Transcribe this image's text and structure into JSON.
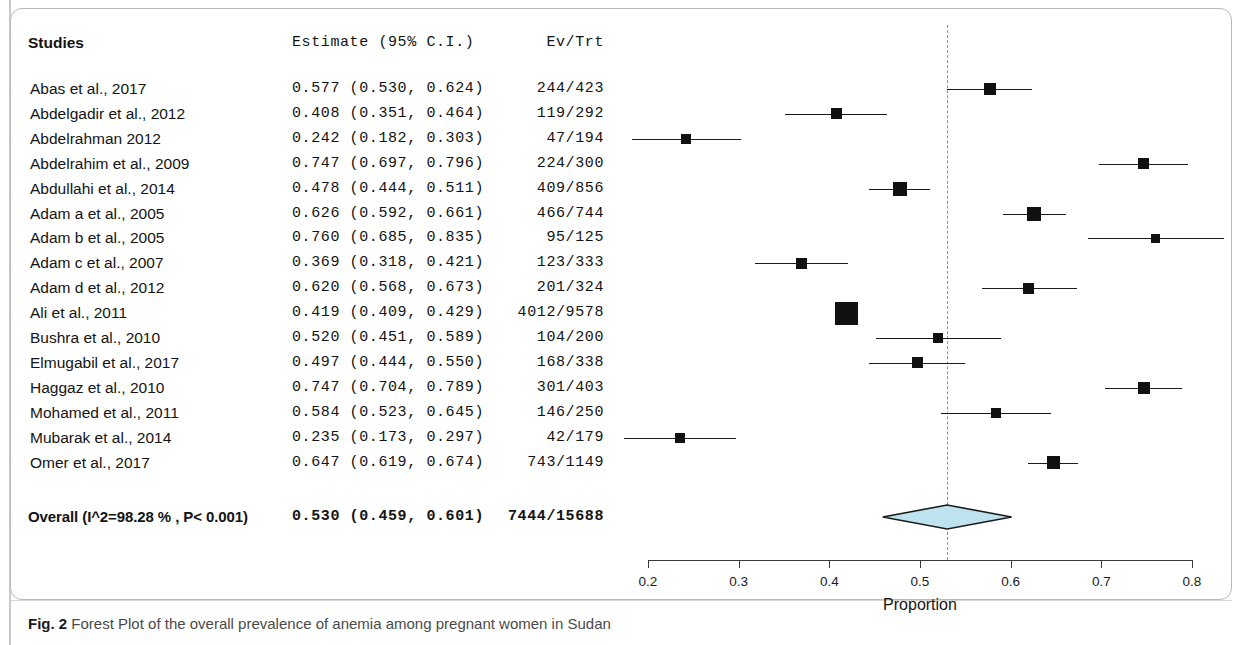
{
  "figure": {
    "caption_label": "Fig. 2",
    "caption_text": "Forest Plot of the overall prevalence of anemia among pregnant women in Sudan"
  },
  "table": {
    "headers": {
      "studies": "Studies",
      "estimate": "Estimate (95% C.I.)",
      "evtrt": "Ev/Trt"
    }
  },
  "chart_data": {
    "type": "forest",
    "title": "Forest Plot of the overall prevalence of anemia among pregnant women in Sudan",
    "xlabel": "Proportion",
    "ylabel": "",
    "xlim": [
      0.2,
      0.8
    ],
    "xticks": [
      0.2,
      0.3,
      0.4,
      0.5,
      0.6,
      0.7,
      0.8
    ],
    "xticklabels": [
      "0.2",
      "0.3",
      "0.4",
      "0.5",
      "0.6",
      "0.7",
      "0.8"
    ],
    "grid": false,
    "reference_line": 0.53,
    "reference_line_color": "#e0705f",
    "marker_color": "#111111",
    "diamond_fill": "#bfe2ef",
    "diamond_stroke": "#1b1b1b",
    "columns": [
      "Studies",
      "Estimate (95% C.I.)",
      "Ev/Trt"
    ],
    "rows": [
      {
        "study": "Abas et al.,  2017",
        "estimate": 0.577,
        "ci_low": 0.53,
        "ci_high": 0.624,
        "estimate_text": "0.577 (0.530, 0.624)",
        "events": 244,
        "total": 423,
        "evtrt": "244/423",
        "weight_px": 12
      },
      {
        "study": "Abdelgadir et al., 2012",
        "estimate": 0.408,
        "ci_low": 0.351,
        "ci_high": 0.464,
        "estimate_text": "0.408 (0.351, 0.464)",
        "events": 119,
        "total": 292,
        "evtrt": "119/292",
        "weight_px": 11
      },
      {
        "study": "Abdelrahman 2012",
        "estimate": 0.242,
        "ci_low": 0.182,
        "ci_high": 0.303,
        "estimate_text": "0.242 (0.182, 0.303)",
        "events": 47,
        "total": 194,
        "evtrt": "47/194",
        "weight_px": 10
      },
      {
        "study": "Abdelrahim et al.,  2009",
        "estimate": 0.747,
        "ci_low": 0.697,
        "ci_high": 0.796,
        "estimate_text": "0.747 (0.697, 0.796)",
        "events": 224,
        "total": 300,
        "evtrt": "224/300",
        "weight_px": 11
      },
      {
        "study": "Abdullahi et al.,  2014",
        "estimate": 0.478,
        "ci_low": 0.444,
        "ci_high": 0.511,
        "estimate_text": "0.478 (0.444, 0.511)",
        "events": 409,
        "total": 856,
        "evtrt": "409/856",
        "weight_px": 14
      },
      {
        "study": "Adam a et al.,  2005",
        "estimate": 0.626,
        "ci_low": 0.592,
        "ci_high": 0.661,
        "estimate_text": "0.626 (0.592, 0.661)",
        "events": 466,
        "total": 744,
        "evtrt": "466/744",
        "weight_px": 14
      },
      {
        "study": "Adam b et al.,  2005",
        "estimate": 0.76,
        "ci_low": 0.685,
        "ci_high": 0.835,
        "estimate_text": "0.760 (0.685, 0.835)",
        "events": 95,
        "total": 125,
        "evtrt": "95/125",
        "weight_px": 9
      },
      {
        "study": "Adam c et al.,  2007",
        "estimate": 0.369,
        "ci_low": 0.318,
        "ci_high": 0.421,
        "estimate_text": "0.369 (0.318, 0.421)",
        "events": 123,
        "total": 333,
        "evtrt": "123/333",
        "weight_px": 11
      },
      {
        "study": "Adam d et al.,  2012",
        "estimate": 0.62,
        "ci_low": 0.568,
        "ci_high": 0.673,
        "estimate_text": "0.620 (0.568, 0.673)",
        "events": 201,
        "total": 324,
        "evtrt": "201/324",
        "weight_px": 11
      },
      {
        "study": "Ali et al., 2011",
        "estimate": 0.419,
        "ci_low": 0.409,
        "ci_high": 0.429,
        "estimate_text": "0.419 (0.409, 0.429)",
        "events": 4012,
        "total": 9578,
        "evtrt": "4012/9578",
        "weight_px": 23
      },
      {
        "study": "Bushra et al., 2010",
        "estimate": 0.52,
        "ci_low": 0.451,
        "ci_high": 0.589,
        "estimate_text": "0.520 (0.451, 0.589)",
        "events": 104,
        "total": 200,
        "evtrt": "104/200",
        "weight_px": 10
      },
      {
        "study": "Elmugabil et al., 2017",
        "estimate": 0.497,
        "ci_low": 0.444,
        "ci_high": 0.55,
        "estimate_text": "0.497 (0.444, 0.550)",
        "events": 168,
        "total": 338,
        "evtrt": "168/338",
        "weight_px": 11
      },
      {
        "study": "Haggaz et al.,  2010",
        "estimate": 0.747,
        "ci_low": 0.704,
        "ci_high": 0.789,
        "estimate_text": "0.747 (0.704, 0.789)",
        "events": 301,
        "total": 403,
        "evtrt": "301/403",
        "weight_px": 12
      },
      {
        "study": "Mohamed et  al.,  2011",
        "estimate": 0.584,
        "ci_low": 0.523,
        "ci_high": 0.645,
        "estimate_text": "0.584 (0.523, 0.645)",
        "events": 146,
        "total": 250,
        "evtrt": "146/250",
        "weight_px": 10
      },
      {
        "study": "Mubarak et al.,  2014",
        "estimate": 0.235,
        "ci_low": 0.173,
        "ci_high": 0.297,
        "estimate_text": "0.235 (0.173, 0.297)",
        "events": 42,
        "total": 179,
        "evtrt": "42/179",
        "weight_px": 10
      },
      {
        "study": "Omer  et al.,  2017",
        "estimate": 0.647,
        "ci_low": 0.619,
        "ci_high": 0.674,
        "estimate_text": "0.647 (0.619, 0.674)",
        "events": 743,
        "total": 1149,
        "evtrt": "743/1149",
        "weight_px": 13
      }
    ],
    "overall": {
      "label": "Overall (I^2=98.28 % , P< 0.001)",
      "estimate": 0.53,
      "ci_low": 0.459,
      "ci_high": 0.601,
      "estimate_text": "0.530 (0.459, 0.601)",
      "events": 7444,
      "total": 15688,
      "evtrt": "7444/15688",
      "i_squared": "98.28 %",
      "p_value": "P< 0.001"
    }
  }
}
